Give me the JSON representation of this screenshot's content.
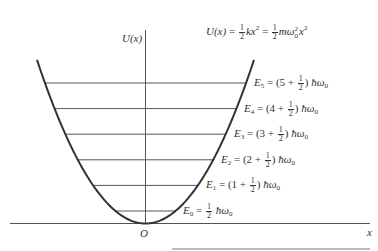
{
  "diagram": {
    "y_axis_label": "U(x)",
    "x_axis_label": "x",
    "origin_label": "O",
    "potential": {
      "lhs": "U(x)",
      "eq": "=",
      "half": {
        "num": "1",
        "den": "2"
      },
      "term1": "kx",
      "exp": "2",
      "term2_m": "mω",
      "omega_sub": "0",
      "term2_x": "x"
    },
    "levels": [
      {
        "n": "0",
        "label_prefix": "E",
        "sub": "0",
        "text": "E0 = 1/2 ħω0"
      },
      {
        "n": "1",
        "label_prefix": "E",
        "sub": "1",
        "text": "E1 = (1 + 1/2) ħω0"
      },
      {
        "n": "2",
        "label_prefix": "E",
        "sub": "2",
        "text": "E2 = (2 + 1/2) ħω0"
      },
      {
        "n": "3",
        "label_prefix": "E",
        "sub": "3",
        "text": "E3 = (3 + 1/2) ħω0"
      },
      {
        "n": "4",
        "label_prefix": "E",
        "sub": "4",
        "text": "E4 = (4 + 1/2) ħω0"
      },
      {
        "n": "5",
        "label_prefix": "E",
        "sub": "5",
        "text": "E5 = (5 + 1/2) ħω0"
      }
    ],
    "hbar_omega": "ħω",
    "plus_half_open": "(",
    "plus": "+",
    "close": ")",
    "colors": {
      "curve": "#333333",
      "lines": "#555555"
    }
  }
}
